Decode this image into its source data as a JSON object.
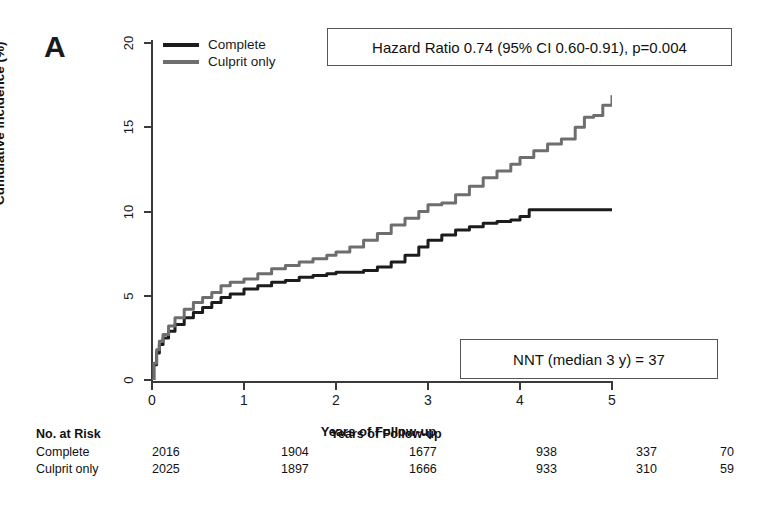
{
  "panel": {
    "label": "A"
  },
  "legend": {
    "position": "top-left",
    "entries": [
      {
        "label": "Complete",
        "color": "#1c1c1c"
      },
      {
        "label": "Culprit only",
        "color": "#6e6e6e"
      }
    ]
  },
  "annotations": [
    {
      "name": "hazard-ratio",
      "text": "Hazard Ratio 0.74 (95% CI 0.60-0.91), p=0.004"
    },
    {
      "name": "nnt",
      "text": "NNT (median 3 y) = 37"
    }
  ],
  "risk_table": {
    "title": "No. at Risk",
    "follow_up_label": "Years of Follow-up",
    "columns": [
      "0",
      "1",
      "2",
      "3",
      "4",
      "5"
    ],
    "rows": [
      {
        "name": "Complete",
        "values": [
          "2016",
          "1904",
          "1677",
          "938",
          "337",
          "70"
        ]
      },
      {
        "name": "Culprit only",
        "values": [
          "2025",
          "1897",
          "1666",
          "933",
          "310",
          "59"
        ]
      }
    ]
  },
  "chart_data": {
    "type": "line",
    "title": "",
    "subtitle": "",
    "xlabel": "Years of Follow-up",
    "ylabel": "Cumulative incidence (%)",
    "xlim": [
      0,
      5
    ],
    "ylim": [
      0,
      20
    ],
    "xticks": [
      0,
      1,
      2,
      3,
      4,
      5
    ],
    "yticks": [
      0,
      5,
      10,
      15,
      20
    ],
    "grid": false,
    "legend_position": "top-left",
    "annotations": [
      "Hazard Ratio 0.74 (95% CI 0.60-0.91), p=0.004",
      "NNT (median 3 y) = 37"
    ],
    "series": [
      {
        "name": "Complete",
        "color": "#1c1c1c",
        "step": true,
        "x": [
          0,
          0.02,
          0.05,
          0.08,
          0.12,
          0.18,
          0.25,
          0.35,
          0.45,
          0.55,
          0.65,
          0.75,
          0.85,
          1.0,
          1.15,
          1.3,
          1.45,
          1.6,
          1.75,
          1.9,
          2.0,
          2.15,
          2.3,
          2.45,
          2.6,
          2.75,
          2.9,
          3.0,
          3.15,
          3.3,
          3.45,
          3.6,
          3.75,
          3.9,
          4.0,
          4.1,
          4.2,
          4.4,
          4.6,
          4.8,
          5.0
        ],
        "y": [
          0.0,
          0.9,
          1.6,
          2.1,
          2.5,
          2.9,
          3.3,
          3.7,
          4.0,
          4.3,
          4.6,
          4.9,
          5.1,
          5.4,
          5.6,
          5.8,
          5.9,
          6.1,
          6.2,
          6.3,
          6.4,
          6.4,
          6.5,
          6.7,
          7.0,
          7.4,
          7.9,
          8.3,
          8.6,
          8.9,
          9.1,
          9.3,
          9.4,
          9.5,
          9.7,
          10.1,
          10.1,
          10.1,
          10.1,
          10.1,
          10.1
        ]
      },
      {
        "name": "Culprit only",
        "color": "#6e6e6e",
        "step": true,
        "x": [
          0,
          0.02,
          0.05,
          0.08,
          0.12,
          0.18,
          0.25,
          0.35,
          0.45,
          0.55,
          0.65,
          0.75,
          0.85,
          1.0,
          1.15,
          1.3,
          1.45,
          1.6,
          1.75,
          1.9,
          2.0,
          2.15,
          2.3,
          2.45,
          2.6,
          2.75,
          2.9,
          3.0,
          3.15,
          3.3,
          3.45,
          3.6,
          3.75,
          3.9,
          4.0,
          4.15,
          4.3,
          4.45,
          4.6,
          4.7,
          4.8,
          4.9,
          5.0
        ],
        "y": [
          0.0,
          1.0,
          1.8,
          2.3,
          2.7,
          3.2,
          3.7,
          4.2,
          4.6,
          4.9,
          5.2,
          5.6,
          5.8,
          6.0,
          6.3,
          6.6,
          6.8,
          7.0,
          7.2,
          7.4,
          7.6,
          7.9,
          8.3,
          8.7,
          9.2,
          9.6,
          10.0,
          10.4,
          10.5,
          11.0,
          11.5,
          12.0,
          12.4,
          12.8,
          13.2,
          13.6,
          14.0,
          14.3,
          15.0,
          15.6,
          15.7,
          16.3,
          16.9
        ]
      }
    ]
  }
}
